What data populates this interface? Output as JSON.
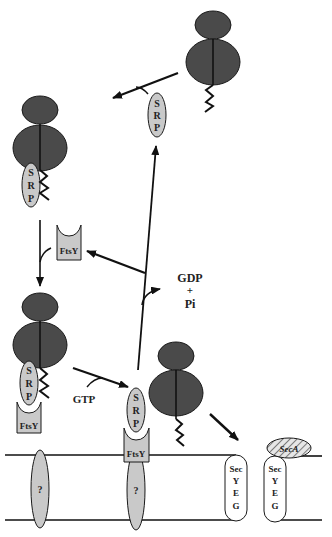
{
  "diagram": {
    "type": "biological-pathway",
    "colors": {
      "ribosome": "#4a4a4a",
      "protein_fill": "#c9c9c9",
      "outline": "#1a1a1a",
      "background": "#ffffff"
    },
    "labels": {
      "srp_letters": [
        "S",
        "R",
        "P"
      ],
      "ftsy": "FtsY",
      "gdp": "GDP",
      "plus": "+",
      "pi": "Pi",
      "gtp": "GTP",
      "unknown_receptor": "?",
      "sec": "Sec",
      "yeg_letters": [
        "Y",
        "E",
        "G"
      ],
      "seca": "SecA"
    },
    "nodes": [
      {
        "id": "ribosome-top-right",
        "desc": "Ribosome with nascent chain (free)"
      },
      {
        "id": "srp-free",
        "desc": "Free SRP"
      },
      {
        "id": "ribosome-srp",
        "desc": "Ribosome bound by SRP at nascent chain"
      },
      {
        "id": "ftsy-free",
        "desc": "Free FtsY"
      },
      {
        "id": "ribosome-srp-ftsy",
        "desc": "Ribosome-SRP-FtsY complex"
      },
      {
        "id": "srp-ftsy-membrane",
        "desc": "SRP-FtsY at membrane receptor (?)"
      },
      {
        "id": "ribosome-released",
        "desc": "Ribosome released to translocon"
      },
      {
        "id": "secyeg-1",
        "desc": "SecYEG translocon"
      },
      {
        "id": "secyeg-seca",
        "desc": "SecYEG with SecA"
      },
      {
        "id": "receptor-1",
        "desc": "Unknown membrane receptor (?)"
      },
      {
        "id": "receptor-2",
        "desc": "Unknown membrane receptor (?) under FtsY"
      }
    ],
    "edges": [
      {
        "from": "ribosome-top-right",
        "to": "ribosome-srp",
        "cofactor": "srp-free"
      },
      {
        "from": "ribosome-srp",
        "to": "ribosome-srp-ftsy",
        "cofactor": "ftsy-free"
      },
      {
        "from": "ribosome-srp-ftsy",
        "to": "srp-ftsy-membrane",
        "label": "GTP"
      },
      {
        "from": "srp-ftsy-membrane",
        "to": "srp-free",
        "label": "GDP + Pi"
      },
      {
        "from": "srp-ftsy-membrane",
        "to": "ftsy-free"
      },
      {
        "from": "ribosome-released",
        "to": "secyeg-1"
      }
    ]
  }
}
